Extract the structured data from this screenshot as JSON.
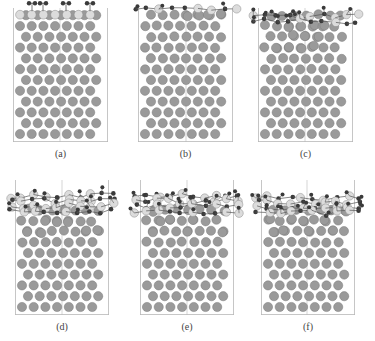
{
  "figure": {
    "colors": {
      "frame": "#b8b8b8",
      "substrate_atom": "#9a9a9a",
      "substrate_stroke": "#7a7a7a",
      "light_atom": "#dcdcdc",
      "light_stroke": "#8a8a8a",
      "dark_atom": "#3a3a3a",
      "bond": "#555555"
    },
    "panels": [
      {
        "id": "a",
        "label": "(a)",
        "x": 13,
        "y": 8,
        "w": 95,
        "h": 134,
        "divider": 47,
        "disorder": 0,
        "adsorbate": "ordered"
      },
      {
        "id": "b",
        "label": "(b)",
        "x": 138,
        "y": 8,
        "w": 95,
        "h": 134,
        "divider": 48,
        "disorder": 1,
        "adsorbate": "chain"
      },
      {
        "id": "c",
        "label": "(c)",
        "x": 258,
        "y": 8,
        "w": 95,
        "h": 134,
        "divider": 47,
        "disorder": 2,
        "adsorbate": "layer"
      },
      {
        "id": "d",
        "label": "(d)",
        "x": 15,
        "y": 180,
        "w": 94,
        "h": 135,
        "divider": 47,
        "disorder": 3,
        "adsorbate": "thick"
      },
      {
        "id": "e",
        "label": "(e)",
        "x": 140,
        "y": 180,
        "w": 94,
        "h": 135,
        "divider": 47,
        "disorder": 3,
        "adsorbate": "thick"
      },
      {
        "id": "f",
        "label": "(f)",
        "x": 261,
        "y": 180,
        "w": 94,
        "h": 135,
        "divider": 46,
        "disorder": 3,
        "adsorbate": "thick2"
      }
    ]
  }
}
